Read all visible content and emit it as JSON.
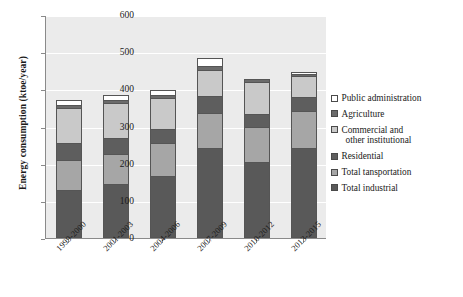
{
  "chart_data": {
    "type": "bar",
    "stacked": true,
    "title": "",
    "xlabel": "",
    "ylabel": "Energy consumption (ktoe/year)",
    "ylim": [
      0,
      600
    ],
    "ytick_step": 100,
    "yticks": [
      "0",
      "100",
      "200",
      "300",
      "400",
      "500",
      "600"
    ],
    "grid": true,
    "legend_position": "right",
    "categories": [
      "1999-2000",
      "2001-2003",
      "2004-2006",
      "2007-2009",
      "2010-2012",
      "2013-2015"
    ],
    "series": [
      {
        "name": "Total industrial",
        "color": "#595959",
        "values": [
          130,
          144,
          167,
          242,
          205,
          242
        ]
      },
      {
        "name": "Total tansportation",
        "color": "#a6a6a6",
        "values": [
          80,
          81,
          88,
          94,
          93,
          101
        ]
      },
      {
        "name": "Residential",
        "color": "#5e5e5e",
        "values": [
          45,
          43,
          37,
          47,
          37,
          36
        ]
      },
      {
        "name": "Commercial and other institutional",
        "color": "#c9c9c9",
        "values": [
          96,
          95,
          84,
          68,
          85,
          58
        ]
      },
      {
        "name": "Agriculture",
        "color": "#6b6b6b",
        "values": [
          8,
          9,
          8,
          13,
          7,
          4
        ]
      },
      {
        "name": "Public administration",
        "color": "#ffffff",
        "values": [
          13,
          14,
          13,
          21,
          0,
          7
        ]
      }
    ],
    "totals": [
      372,
      386,
      397,
      485,
      427,
      448
    ],
    "annotations": []
  },
  "legend": {
    "entries": [
      {
        "label": "Public administration",
        "label_line2": ""
      },
      {
        "label": "Agriculture",
        "label_line2": ""
      },
      {
        "label": "Commercial and",
        "label_line2": "other institutional"
      },
      {
        "label": "Residential",
        "label_line2": ""
      },
      {
        "label": "Total tansportation",
        "label_line2": ""
      },
      {
        "label": "Total industrial",
        "label_line2": ""
      }
    ]
  }
}
